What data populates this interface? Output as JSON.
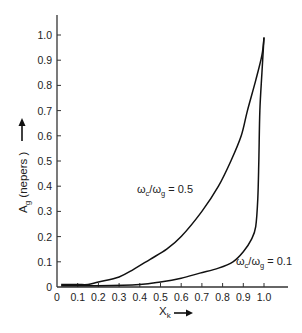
{
  "chart_data": {
    "type": "line",
    "title": "",
    "xlabel": "X_k",
    "xlabel_main": "X",
    "xlabel_sub": "k",
    "ylabel": "A_g (nepers)",
    "ylabel_main": "A",
    "ylabel_sub": "g",
    "ylabel_rest": " (nepers )",
    "xlim": [
      0,
      1.1
    ],
    "ylim": [
      0,
      1.05
    ],
    "grid": false,
    "legend": "none (inline annotations)",
    "x_ticks": [
      "0",
      "0.1",
      "0.2",
      "0.3",
      "0.4",
      "0.5",
      "0.6",
      "0.7",
      "0.8",
      "0.9",
      "1.0"
    ],
    "y_ticks": [
      "0",
      "0.1",
      "0.2",
      "0.3",
      "0.4",
      "0.5",
      "0.6",
      "0.7",
      "0.8",
      "0.9",
      "1.0"
    ],
    "series": [
      {
        "name": "ωc/ωg = 0.5",
        "annotation": {
          "w1": "ω",
          "s1": "c",
          "mid": "/ω",
          "s2": "g",
          "rest": " = 0.5"
        },
        "x": [
          0.02,
          0.1,
          0.15,
          0.2,
          0.3,
          0.37,
          0.45,
          0.53,
          0.6,
          0.7,
          0.78,
          0.84,
          0.89,
          0.92,
          0.96,
          0.99,
          1.0
        ],
        "y": [
          0.01,
          0.01,
          0.01,
          0.02,
          0.04,
          0.07,
          0.11,
          0.15,
          0.2,
          0.3,
          0.4,
          0.5,
          0.6,
          0.7,
          0.82,
          0.92,
          0.99
        ]
      },
      {
        "name": "ωc/ωg = 0.1",
        "annotation": {
          "w1": "ω",
          "s1": "c",
          "mid": "/ω",
          "s2": "g",
          "rest": " = 0.1"
        },
        "x": [
          0.02,
          0.2,
          0.4,
          0.5,
          0.6,
          0.69,
          0.78,
          0.85,
          0.9,
          0.94,
          0.96,
          0.97,
          0.975,
          0.98,
          0.99,
          1.0
        ],
        "y": [
          0.005,
          0.005,
          0.01,
          0.02,
          0.035,
          0.055,
          0.075,
          0.1,
          0.14,
          0.19,
          0.24,
          0.35,
          0.5,
          0.7,
          0.85,
          0.99
        ]
      }
    ]
  }
}
